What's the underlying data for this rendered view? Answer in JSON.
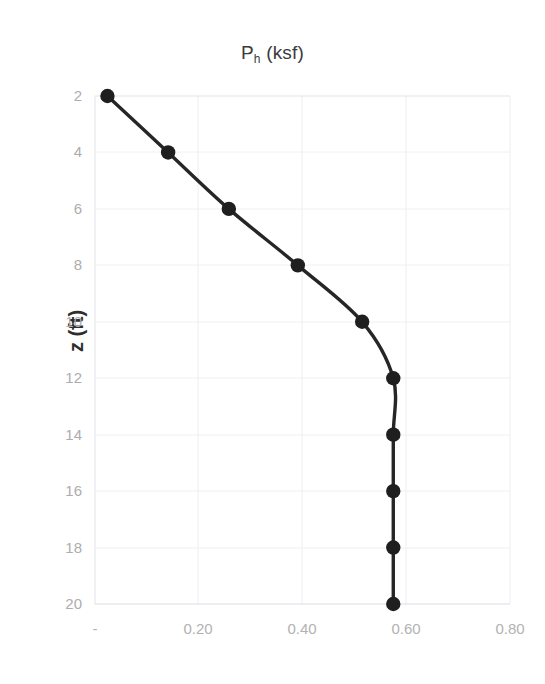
{
  "chart_data": {
    "type": "line",
    "title_main": "P",
    "title_sub": "h",
    "title_rest": " (ksf)",
    "xlabel": "",
    "ylabel": "z (ft)",
    "x": [
      0.024,
      0.141,
      0.258,
      0.391,
      0.515,
      0.575,
      0.575,
      0.575,
      0.575,
      0.575
    ],
    "y": [
      2,
      4,
      6,
      8,
      10,
      12,
      14,
      16,
      18,
      20
    ],
    "series": [
      {
        "name": "Ph",
        "points": [
          {
            "Ph": 0.024,
            "z": 2
          },
          {
            "Ph": 0.141,
            "z": 4
          },
          {
            "Ph": 0.258,
            "z": 6
          },
          {
            "Ph": 0.391,
            "z": 8
          },
          {
            "Ph": 0.515,
            "z": 10
          },
          {
            "Ph": 0.575,
            "z": 12
          },
          {
            "Ph": 0.575,
            "z": 14
          },
          {
            "Ph": 0.575,
            "z": 16
          },
          {
            "Ph": 0.575,
            "z": 18
          },
          {
            "Ph": 0.575,
            "z": 20
          }
        ]
      }
    ],
    "xlim": [
      0.0,
      0.8
    ],
    "ylim": [
      2,
      20
    ],
    "y_inverted": true,
    "xticks": [
      0.0,
      0.2,
      0.4,
      0.6,
      0.8
    ],
    "xtick_labels": [
      "-",
      "0.20",
      "0.40",
      "0.60",
      "0.80"
    ],
    "yticks": [
      2,
      4,
      6,
      8,
      10,
      12,
      14,
      16,
      18,
      20
    ],
    "ytick_labels": [
      "2",
      "4",
      "6",
      "8",
      "10",
      "12",
      "14",
      "16",
      "18",
      "20"
    ],
    "grid": true,
    "grid_color": "#eceaf0",
    "legend": null,
    "line_color": "#1f1f1f",
    "marker": "circle",
    "marker_color": "#1f1f1f",
    "smoothed": true
  },
  "axis": {
    "x_tick_0": "-",
    "x_tick_1": "0.20",
    "x_tick_2": "0.40",
    "x_tick_3": "0.60",
    "x_tick_4": "0.80",
    "y_tick_0": "2",
    "y_tick_1": "4",
    "y_tick_2": "6",
    "y_tick_3": "8",
    "y_tick_4": "10",
    "y_tick_5": "12",
    "y_tick_6": "14",
    "y_tick_7": "16",
    "y_tick_8": "18",
    "y_tick_9": "20"
  }
}
